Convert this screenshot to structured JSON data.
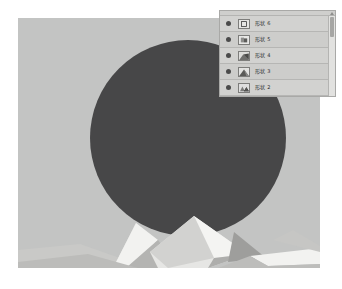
{
  "canvas": {
    "name": "artboard",
    "background_color": "#c3c4c3",
    "shapes": {
      "circle": {
        "name": "dark-circle",
        "color": "#474748",
        "cx": 170,
        "cy": 120,
        "r": 98
      },
      "mountains": {
        "name": "low-poly-mountains",
        "colors": {
          "white": "#f2f2f0",
          "light": "#d8d8d6",
          "mid": "#c9c9c7",
          "shadow": "#b4b4b2",
          "dark": "#9e9e9c"
        }
      }
    }
  },
  "layers_panel": {
    "title": "",
    "scrollbar": {
      "up_arrow_icon": "triangle-up-icon",
      "thumb": "scroll-thumb"
    },
    "rows": [
      {
        "visible_icon": "eye-icon",
        "thumbnail": "square-outline-thumb",
        "name": "形状 6"
      },
      {
        "visible_icon": "eye-icon",
        "thumbnail": "shape-thumb",
        "name": "形状 5"
      },
      {
        "visible_icon": "eye-icon",
        "thumbnail": "shape-thumb",
        "name": "形状 4"
      },
      {
        "visible_icon": "eye-icon",
        "thumbnail": "shape-thumb",
        "name": "形状 3"
      },
      {
        "visible_icon": "eye-icon",
        "thumbnail": "shape-thumb",
        "name": "形状 2"
      }
    ]
  }
}
